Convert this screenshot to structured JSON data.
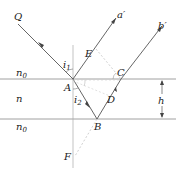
{
  "diagram": {
    "type": "optics-thin-film-reflection",
    "media": [
      {
        "name": "top_medium",
        "label": "n",
        "subscript": "0"
      },
      {
        "name": "film",
        "label": "n",
        "subscript": ""
      },
      {
        "name": "bottom_medium",
        "label": "n",
        "subscript": "0"
      }
    ],
    "points": {
      "Q": "Q",
      "A": "A",
      "B": "B",
      "C": "C",
      "D": "D",
      "E": "E",
      "F": "F",
      "a_prime": "a′",
      "b_prime": "b′"
    },
    "angles": {
      "incidence": {
        "label": "i",
        "subscript": "1"
      },
      "refraction": {
        "label": "i",
        "subscript": "2"
      }
    },
    "thickness": {
      "label": "h"
    },
    "colors": {
      "line": "#555555",
      "dashed": "#aaaaaa",
      "text": "#222222"
    }
  }
}
